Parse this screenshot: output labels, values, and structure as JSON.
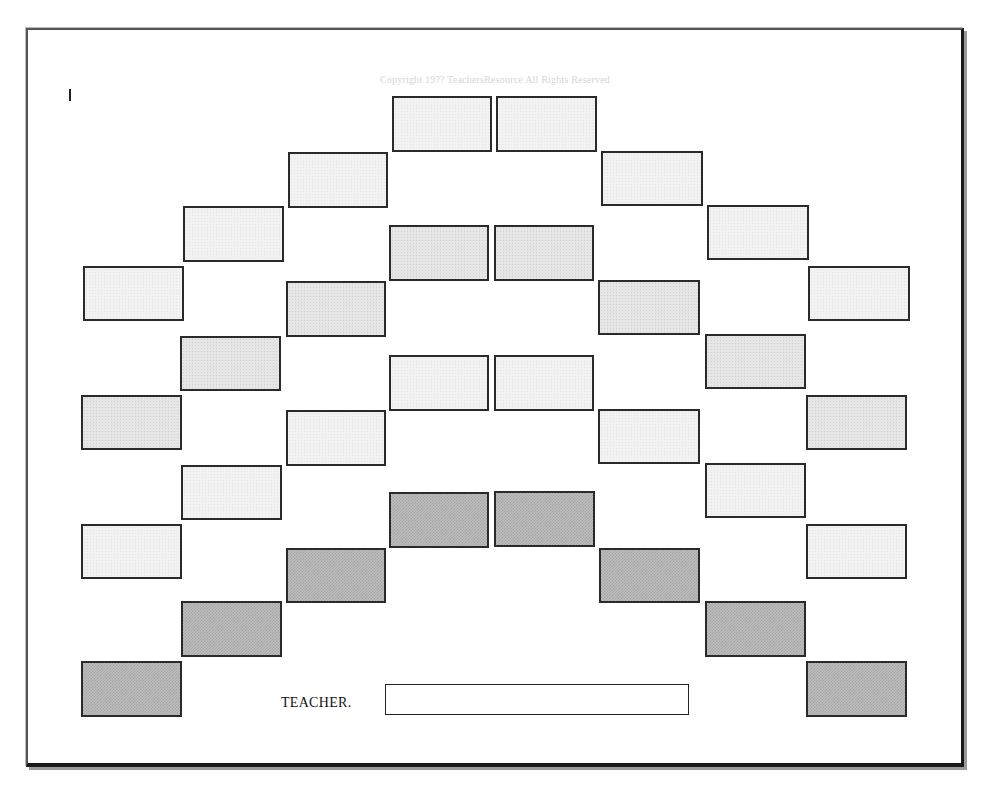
{
  "copyright": "Copyright 19?? TeachersResource  All Rights Reserved",
  "cursor_mark": "I",
  "teacher": {
    "label": "TEACHER.",
    "name_value": ""
  },
  "colors": {
    "border": "#1a1a1a",
    "desk_light": "#f2f2f2",
    "desk_medium": "#e6e6e6",
    "desk_dark": "#bdbdbd",
    "copyright_text": "#d6d6d6"
  },
  "desks": [
    {
      "id": "desk-1",
      "x": 392,
      "y": 96,
      "w": 100,
      "h": 56,
      "shade": "light"
    },
    {
      "id": "desk-2",
      "x": 496,
      "y": 96,
      "w": 101,
      "h": 56,
      "shade": "light"
    },
    {
      "id": "desk-3",
      "x": 288,
      "y": 152,
      "w": 100,
      "h": 56,
      "shade": "light"
    },
    {
      "id": "desk-4",
      "x": 601,
      "y": 151,
      "w": 102,
      "h": 55,
      "shade": "light"
    },
    {
      "id": "desk-5",
      "x": 183,
      "y": 206,
      "w": 101,
      "h": 56,
      "shade": "light"
    },
    {
      "id": "desk-6",
      "x": 707,
      "y": 205,
      "w": 102,
      "h": 55,
      "shade": "light"
    },
    {
      "id": "desk-7",
      "x": 389,
      "y": 225,
      "w": 100,
      "h": 56,
      "shade": "medium"
    },
    {
      "id": "desk-8",
      "x": 494,
      "y": 225,
      "w": 100,
      "h": 56,
      "shade": "medium"
    },
    {
      "id": "desk-9",
      "x": 83,
      "y": 266,
      "w": 101,
      "h": 55,
      "shade": "light"
    },
    {
      "id": "desk-10",
      "x": 808,
      "y": 266,
      "w": 102,
      "h": 55,
      "shade": "light"
    },
    {
      "id": "desk-11",
      "x": 286,
      "y": 281,
      "w": 100,
      "h": 56,
      "shade": "medium"
    },
    {
      "id": "desk-12",
      "x": 598,
      "y": 280,
      "w": 102,
      "h": 55,
      "shade": "medium"
    },
    {
      "id": "desk-13",
      "x": 180,
      "y": 336,
      "w": 101,
      "h": 55,
      "shade": "medium"
    },
    {
      "id": "desk-14",
      "x": 705,
      "y": 334,
      "w": 101,
      "h": 55,
      "shade": "medium"
    },
    {
      "id": "desk-15",
      "x": 389,
      "y": 355,
      "w": 100,
      "h": 56,
      "shade": "light"
    },
    {
      "id": "desk-16",
      "x": 494,
      "y": 355,
      "w": 100,
      "h": 56,
      "shade": "light"
    },
    {
      "id": "desk-17",
      "x": 81,
      "y": 395,
      "w": 101,
      "h": 55,
      "shade": "medium"
    },
    {
      "id": "desk-18",
      "x": 806,
      "y": 395,
      "w": 101,
      "h": 55,
      "shade": "medium"
    },
    {
      "id": "desk-19",
      "x": 286,
      "y": 410,
      "w": 100,
      "h": 56,
      "shade": "light"
    },
    {
      "id": "desk-20",
      "x": 598,
      "y": 409,
      "w": 102,
      "h": 55,
      "shade": "light"
    },
    {
      "id": "desk-21",
      "x": 181,
      "y": 465,
      "w": 101,
      "h": 55,
      "shade": "light"
    },
    {
      "id": "desk-22",
      "x": 705,
      "y": 463,
      "w": 101,
      "h": 55,
      "shade": "light"
    },
    {
      "id": "desk-23",
      "x": 389,
      "y": 492,
      "w": 100,
      "h": 56,
      "shade": "dark"
    },
    {
      "id": "desk-24",
      "x": 494,
      "y": 491,
      "w": 101,
      "h": 56,
      "shade": "dark"
    },
    {
      "id": "desk-25",
      "x": 81,
      "y": 524,
      "w": 101,
      "h": 55,
      "shade": "light"
    },
    {
      "id": "desk-26",
      "x": 806,
      "y": 524,
      "w": 101,
      "h": 55,
      "shade": "light"
    },
    {
      "id": "desk-27",
      "x": 286,
      "y": 548,
      "w": 100,
      "h": 55,
      "shade": "dark"
    },
    {
      "id": "desk-28",
      "x": 599,
      "y": 548,
      "w": 101,
      "h": 55,
      "shade": "dark"
    },
    {
      "id": "desk-29",
      "x": 181,
      "y": 601,
      "w": 101,
      "h": 56,
      "shade": "dark"
    },
    {
      "id": "desk-30",
      "x": 705,
      "y": 601,
      "w": 101,
      "h": 56,
      "shade": "dark"
    },
    {
      "id": "desk-31",
      "x": 81,
      "y": 661,
      "w": 101,
      "h": 56,
      "shade": "dark"
    },
    {
      "id": "desk-32",
      "x": 806,
      "y": 661,
      "w": 101,
      "h": 56,
      "shade": "dark"
    }
  ]
}
